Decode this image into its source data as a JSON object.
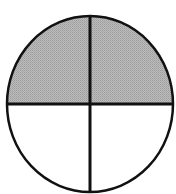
{
  "diagram": {
    "type": "fraction-circle",
    "total_parts": 4,
    "shaded_parts": 2,
    "shaded_regions": [
      "top-left",
      "top-right"
    ],
    "unshaded_regions": [
      "bottom-left",
      "bottom-right"
    ],
    "colors": {
      "background": "#ffffff",
      "shaded_fill": "#b4b4b4",
      "unshaded_fill": "#ffffff",
      "stroke": "#111111"
    }
  }
}
